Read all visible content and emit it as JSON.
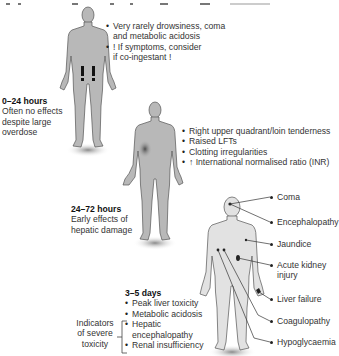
{
  "caption": "Figure: Clinical stages and symptoms of paracetamol overdose",
  "stages": [
    {
      "time": "0–24 hours",
      "description": [
        "Often no effects",
        "despite large",
        "overdose"
      ],
      "bullets": [
        "Very rarely drowsiness, coma",
        "and metabolic acidosis",
        "! If symptoms, consider",
        "if co-ingestant !"
      ],
      "bullet_items": [
        {
          "lines": [
            "Very rarely drowsiness, coma",
            "and metabolic acidosis"
          ]
        },
        {
          "lines": [
            "! If symptoms, consider",
            "if co-ingestant !"
          ]
        }
      ],
      "figure_marker": "exclamation-marks"
    },
    {
      "time": "24–72 hours",
      "description": [
        "Early effects of",
        "hepatic damage"
      ],
      "bullets": [
        "Right upper quadrant/loin tenderness",
        "Raised LFTs",
        "Clotting irregularities",
        "↑ International normalised ratio (INR)"
      ],
      "figure_marker": "liver-shading"
    },
    {
      "time": "3–5 days",
      "bullets": [
        "Peak liver toxicity",
        "Metabolic acidosis",
        "Hepatic",
        "encephalopathy",
        "Renal insufficiency"
      ],
      "severe_label": [
        "Indicators",
        "of severe",
        "toxicity"
      ],
      "organ_labels": [
        "Coma",
        "Encephalopathy",
        "Jaundice",
        "Acute kidney",
        "injury",
        "Liver failure",
        "Coagulopathy",
        "Hypoglycaemia"
      ]
    }
  ],
  "colors": {
    "body_fill": "#b8b8b8",
    "body_stroke": "#555555",
    "body_light": "#e2e2e2",
    "shadow": "#9a9a9a",
    "liver_shade": "#6e6e6e",
    "text": "#333333"
  }
}
